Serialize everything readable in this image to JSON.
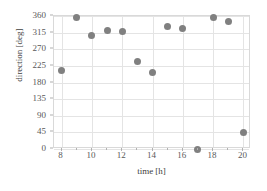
{
  "chart_data": {
    "type": "scatter",
    "title": "",
    "xlabel": "time [h]",
    "ylabel": "direction [deg]",
    "xlim": [
      7.5,
      20.5
    ],
    "ylim": [
      0,
      360
    ],
    "grid": true,
    "legend": null,
    "marker_color": "#808080",
    "gridline_color": "#e4e4e4",
    "plot_border_color": "#d9d9d9",
    "x_ticks": [
      8,
      10,
      12,
      14,
      16,
      18,
      20
    ],
    "x_minor_ticks": [
      9,
      11,
      13,
      15,
      17,
      19
    ],
    "y_ticks": [
      0,
      45,
      90,
      135,
      180,
      225,
      270,
      315,
      360
    ],
    "x_tick_labels": [
      "8",
      "10",
      "12",
      "14",
      "16",
      "18",
      "20"
    ],
    "y_tick_labels": [
      "0",
      "45",
      "90",
      "135",
      "180",
      "225",
      "270",
      "315",
      "360"
    ],
    "series": [
      {
        "name": "direction",
        "points": [
          {
            "x": 8,
            "y": 212
          },
          {
            "x": 9,
            "y": 357
          },
          {
            "x": 10,
            "y": 308
          },
          {
            "x": 11,
            "y": 322
          },
          {
            "x": 12,
            "y": 317
          },
          {
            "x": 13,
            "y": 237
          },
          {
            "x": 14,
            "y": 207
          },
          {
            "x": 15,
            "y": 332
          },
          {
            "x": 16,
            "y": 325
          },
          {
            "x": 17,
            "y": 0
          },
          {
            "x": 18,
            "y": 357
          },
          {
            "x": 19,
            "y": 345
          },
          {
            "x": 20,
            "y": 45
          }
        ]
      }
    ]
  }
}
